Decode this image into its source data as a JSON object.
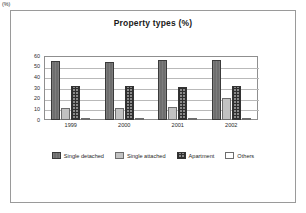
{
  "chart_data": {
    "type": "bar",
    "title": "Property types (%)",
    "xlabel": "",
    "ylabel": "(%)",
    "y_unit_label": "(%)",
    "categories": [
      "1999",
      "2000",
      "2001",
      "2002"
    ],
    "ylim": [
      0,
      60
    ],
    "yticks": [
      60,
      50,
      40,
      30,
      20,
      10,
      0
    ],
    "grid": true,
    "legend_position": "bottom",
    "series": [
      {
        "name": "Single detached",
        "values": [
          55,
          54,
          56,
          56.5
        ],
        "color": "#6e6e6e",
        "fill": "solid-dark-gray"
      },
      {
        "name": "Single attached",
        "values": [
          11,
          11.5,
          12,
          20.5
        ],
        "color": "#c2c2c2",
        "fill": "solid-light-gray"
      },
      {
        "name": "Apartment",
        "values": [
          32,
          32,
          31,
          32
        ],
        "color": "#8a8a8a",
        "fill": "crosshatch-grid"
      },
      {
        "name": "Others",
        "values": [
          1,
          1.5,
          1.5,
          1.5
        ],
        "color": "#ffffff",
        "fill": "white-outline"
      }
    ]
  }
}
